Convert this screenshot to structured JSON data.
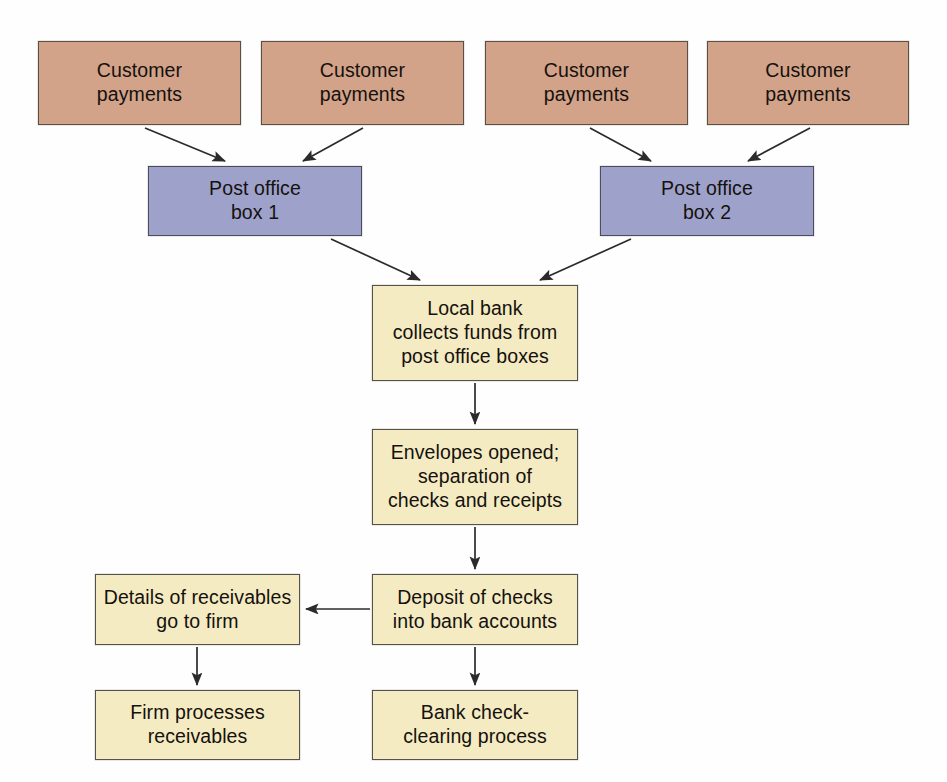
{
  "diagram": {
    "type": "flowchart",
    "background_color": "#fefefe",
    "palette": {
      "source_fill": "#d2a289",
      "lockbox_fill": "#9ea2ca",
      "process_fill": "#f4ebc3",
      "border": "#4a4a4a",
      "text": "#15110d",
      "arrow": "#2b2b2b"
    },
    "nodes": [
      {
        "id": "customer-payments-1",
        "label": "Customer\npayments",
        "kind": "source",
        "x": 38,
        "y": 41,
        "w": 203,
        "h": 84
      },
      {
        "id": "customer-payments-2",
        "label": "Customer\npayments",
        "kind": "source",
        "x": 261,
        "y": 41,
        "w": 203,
        "h": 84
      },
      {
        "id": "customer-payments-3",
        "label": "Customer\npayments",
        "kind": "source",
        "x": 485,
        "y": 41,
        "w": 203,
        "h": 84
      },
      {
        "id": "customer-payments-4",
        "label": "Customer\npayments",
        "kind": "source",
        "x": 707,
        "y": 41,
        "w": 202,
        "h": 84
      },
      {
        "id": "post-office-box-1",
        "label": "Post office\nbox 1",
        "kind": "lockbox",
        "x": 148,
        "y": 166,
        "w": 214,
        "h": 70
      },
      {
        "id": "post-office-box-2",
        "label": "Post office\nbox 2",
        "kind": "lockbox",
        "x": 600,
        "y": 166,
        "w": 214,
        "h": 70
      },
      {
        "id": "local-bank-collects",
        "label": "Local bank\ncollects funds from\npost office boxes",
        "kind": "process",
        "x": 372,
        "y": 285,
        "w": 206,
        "h": 96
      },
      {
        "id": "envelopes-opened",
        "label": "Envelopes opened;\nseparation of\nchecks and receipts",
        "kind": "process",
        "x": 372,
        "y": 429,
        "w": 206,
        "h": 96
      },
      {
        "id": "deposit-of-checks",
        "label": "Deposit of checks\ninto bank accounts",
        "kind": "process",
        "x": 372,
        "y": 574,
        "w": 206,
        "h": 71
      },
      {
        "id": "details-of-receivables",
        "label": "Details of receivables\ngo to firm",
        "kind": "process",
        "x": 95,
        "y": 574,
        "w": 205,
        "h": 71
      },
      {
        "id": "firm-processes-receivables",
        "label": "Firm processes\nreceivables",
        "kind": "process",
        "x": 95,
        "y": 690,
        "w": 205,
        "h": 70
      },
      {
        "id": "bank-check-clearing",
        "label": "Bank check-\nclearing process",
        "kind": "process",
        "x": 372,
        "y": 690,
        "w": 206,
        "h": 70
      }
    ],
    "edges": [
      {
        "id": "edge-cp1-pob1",
        "from": "customer-payments-1",
        "to": "post-office-box-1",
        "x1": 145,
        "y1": 128,
        "x2": 225,
        "y2": 161
      },
      {
        "id": "edge-cp2-pob1",
        "from": "customer-payments-2",
        "to": "post-office-box-1",
        "x1": 363,
        "y1": 128,
        "x2": 303,
        "y2": 161
      },
      {
        "id": "edge-cp3-pob2",
        "from": "customer-payments-3",
        "to": "post-office-box-2",
        "x1": 590,
        "y1": 128,
        "x2": 651,
        "y2": 161
      },
      {
        "id": "edge-cp4-pob2",
        "from": "customer-payments-4",
        "to": "post-office-box-2",
        "x1": 810,
        "y1": 128,
        "x2": 748,
        "y2": 161
      },
      {
        "id": "edge-pob1-bank",
        "from": "post-office-box-1",
        "to": "local-bank-collects",
        "x1": 331,
        "y1": 239,
        "x2": 420,
        "y2": 280
      },
      {
        "id": "edge-pob2-bank",
        "from": "post-office-box-2",
        "to": "local-bank-collects",
        "x1": 631,
        "y1": 239,
        "x2": 540,
        "y2": 280
      },
      {
        "id": "edge-bank-envelopes",
        "from": "local-bank-collects",
        "to": "envelopes-opened",
        "x1": 475,
        "y1": 383,
        "x2": 475,
        "y2": 424
      },
      {
        "id": "edge-envelopes-deposit",
        "from": "envelopes-opened",
        "to": "deposit-of-checks",
        "x1": 475,
        "y1": 527,
        "x2": 475,
        "y2": 569
      },
      {
        "id": "edge-deposit-details",
        "from": "deposit-of-checks",
        "to": "details-of-receivables",
        "x1": 370,
        "y1": 609,
        "x2": 305,
        "y2": 609
      },
      {
        "id": "edge-details-firm",
        "from": "details-of-receivables",
        "to": "firm-processes-receivables",
        "x1": 197,
        "y1": 647,
        "x2": 197,
        "y2": 685
      },
      {
        "id": "edge-deposit-clearing",
        "from": "deposit-of-checks",
        "to": "bank-check-clearing",
        "x1": 475,
        "y1": 647,
        "x2": 475,
        "y2": 685
      }
    ]
  }
}
